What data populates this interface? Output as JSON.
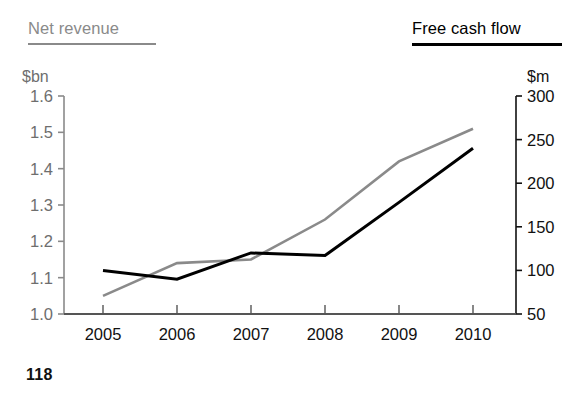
{
  "legends": {
    "left": {
      "label": "Net revenue",
      "color": "#8a8a8a"
    },
    "right": {
      "label": "Free cash flow",
      "color": "#000000"
    }
  },
  "axis_units": {
    "left": "$bn",
    "right": "$m"
  },
  "page_number": "118",
  "chart_data": {
    "type": "line",
    "title": "",
    "subtitle": "",
    "xlabel": "",
    "categories": [
      "2005",
      "2006",
      "2007",
      "2008",
      "2009",
      "2010"
    ],
    "x": [
      2005,
      2006,
      2007,
      2008,
      2009,
      2010
    ],
    "grid": false,
    "legend_position": "top",
    "axes": {
      "left": {
        "name": "Net revenue",
        "unit": "$bn",
        "ylabel": "$bn",
        "ylim": [
          1.0,
          1.6
        ],
        "ticks": [
          1.0,
          1.1,
          1.2,
          1.3,
          1.4,
          1.5,
          1.6
        ],
        "tick_labels": [
          "1.0",
          "1.1",
          "1.2",
          "1.3",
          "1.4",
          "1.5",
          "1.6"
        ],
        "color": "#8a8a8a"
      },
      "right": {
        "name": "Free cash flow",
        "unit": "$m",
        "ylabel": "$m",
        "ylim": [
          50,
          300
        ],
        "ticks": [
          50,
          100,
          150,
          200,
          250,
          300
        ],
        "tick_labels": [
          "50",
          "100",
          "150",
          "200",
          "250",
          "300"
        ],
        "color": "#111111"
      }
    },
    "series": [
      {
        "name": "Net revenue",
        "unit": "$bn",
        "axis": "left",
        "color": "#8a8a8a",
        "values": [
          1.05,
          1.14,
          1.15,
          1.26,
          1.42,
          1.51
        ]
      },
      {
        "name": "Free cash flow",
        "unit": "$m",
        "axis": "right",
        "color": "#000000",
        "values": [
          100,
          90,
          120,
          117,
          178,
          240
        ]
      }
    ]
  }
}
